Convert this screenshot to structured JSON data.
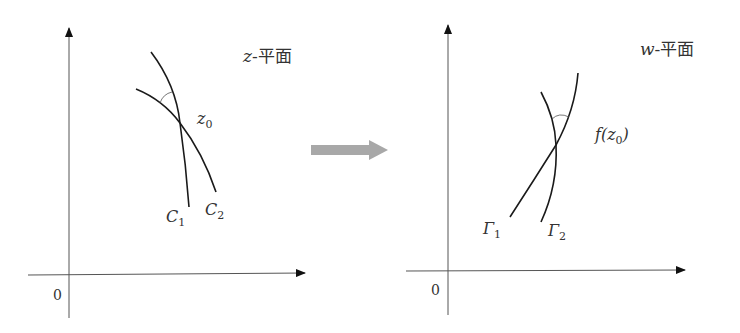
{
  "diagram": {
    "left_panel": {
      "plane_label": "z-平面",
      "plane_var": "z",
      "plane_suffix": "-平面",
      "origin_label": "0",
      "point_label": "z",
      "point_sub": "0",
      "curves": [
        {
          "name": "C",
          "sub": "1"
        },
        {
          "name": "C",
          "sub": "2"
        }
      ]
    },
    "mapping_arrow": {
      "direction": "right",
      "color": "#a8a8a8"
    },
    "right_panel": {
      "plane_label": "w-平面",
      "plane_var": "w",
      "plane_suffix": "-平面",
      "origin_label": "0",
      "point_label_pre": "f(",
      "point_label_var": "z",
      "point_sub": "0",
      "point_label_post": ")",
      "curves": [
        {
          "name": "Γ",
          "sub": "1"
        },
        {
          "name": "Γ",
          "sub": "2"
        }
      ]
    },
    "colors": {
      "line": "#1a1a1a",
      "axis": "#333333",
      "text": "#333333",
      "arrow": "#a8a8a8"
    }
  }
}
